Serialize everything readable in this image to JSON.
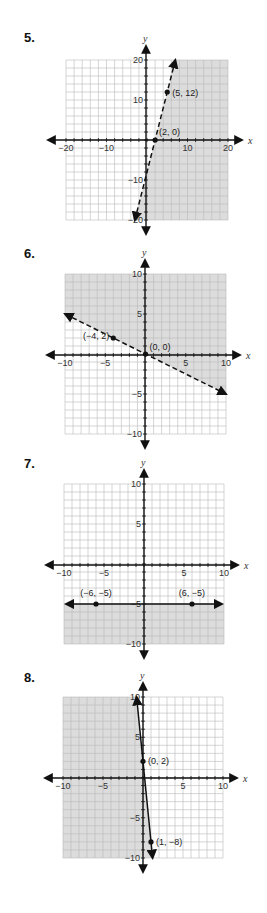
{
  "colors": {
    "shade": "#dcdcdc",
    "grid": "#b8b8b8",
    "axis": "#111111",
    "line": "#111111"
  },
  "chart_data": [
    {
      "type": "line",
      "problem": "5.",
      "title": "",
      "xlabel": "x",
      "ylabel": "y",
      "xlim": [
        -20,
        20
      ],
      "ylim": [
        -20,
        20
      ],
      "x_ticks": [
        "-20",
        "-10",
        "10",
        "20"
      ],
      "y_ticks": [
        "20",
        "10",
        "-10",
        "-20"
      ],
      "grid": true,
      "line_style": "dashed",
      "points": [
        {
          "x": 2,
          "y": 0,
          "label": "(2, 0)"
        },
        {
          "x": 5,
          "y": 12,
          "label": "(5, 12)"
        }
      ],
      "equation": "y = 4x - 8",
      "shaded_region": "right/below line (y < 4x - 8)"
    },
    {
      "type": "line",
      "problem": "6.",
      "xlabel": "x",
      "ylabel": "y",
      "xlim": [
        -10,
        10
      ],
      "ylim": [
        -10,
        10
      ],
      "x_ticks": [
        "-10",
        "-5",
        "5",
        "10"
      ],
      "y_ticks": [
        "10",
        "5",
        "-5",
        "-10"
      ],
      "grid": true,
      "line_style": "dashed",
      "points": [
        {
          "x": -4,
          "y": 2,
          "label": "(-4, 2)"
        },
        {
          "x": 0,
          "y": 0,
          "label": "(0, 0)"
        }
      ],
      "equation": "y = -0.5x",
      "shaded_region": "above line (y > -x/2)"
    },
    {
      "type": "line",
      "problem": "7.",
      "xlabel": "x",
      "ylabel": "y",
      "xlim": [
        -10,
        10
      ],
      "ylim": [
        -10,
        10
      ],
      "x_ticks": [
        "-10",
        "-5",
        "5",
        "10"
      ],
      "y_ticks": [
        "10",
        "5",
        "-5",
        "-10"
      ],
      "grid": true,
      "line_style": "solid",
      "points": [
        {
          "x": -6,
          "y": -5,
          "label": "(-6, -5)"
        },
        {
          "x": 6,
          "y": -5,
          "label": "(6, -5)"
        }
      ],
      "equation": "y = -5",
      "shaded_region": "below line (y <= -5)"
    },
    {
      "type": "line",
      "problem": "8.",
      "xlabel": "x",
      "ylabel": "y",
      "xlim": [
        -10,
        10
      ],
      "ylim": [
        -10,
        10
      ],
      "x_ticks": [
        "-10",
        "-5",
        "5",
        "10"
      ],
      "y_ticks": [
        "10",
        "5",
        "-5",
        "-10"
      ],
      "grid": true,
      "line_style": "solid",
      "points": [
        {
          "x": 0,
          "y": 2,
          "label": "(0, 2)"
        },
        {
          "x": 1,
          "y": -8,
          "label": "(1, -8)"
        }
      ],
      "equation": "y = -10x + 2",
      "shaded_region": "left of line (y <= -10x + 2)"
    }
  ]
}
